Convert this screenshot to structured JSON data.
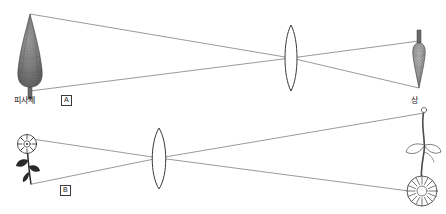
{
  "figure": {
    "background_color": "#ffffff",
    "line_color": "#6e6e6e",
    "ink_color": "#1a1a1a",
    "width": 446,
    "height": 214
  },
  "labels": {
    "subject_top": "피사체",
    "panel_a": "A",
    "panel_b": "B",
    "image_right": "상"
  },
  "panels": [
    {
      "id": "A",
      "badge": "A",
      "object": {
        "name": "tree",
        "side": "left",
        "orientation": "upright",
        "label": "피사체"
      },
      "lens": {
        "type": "biconvex",
        "position": "center-right"
      },
      "image": {
        "name": "tree",
        "side": "right",
        "orientation": "inverted",
        "relative_size": "smaller"
      }
    },
    {
      "id": "B",
      "badge": "B",
      "object": {
        "name": "flower",
        "side": "left",
        "orientation": "upright",
        "label": "피사체"
      },
      "lens": {
        "type": "biconvex",
        "position": "center-left"
      },
      "image": {
        "name": "flower",
        "side": "right",
        "orientation": "inverted",
        "relative_size": "larger",
        "label": "상"
      }
    }
  ]
}
